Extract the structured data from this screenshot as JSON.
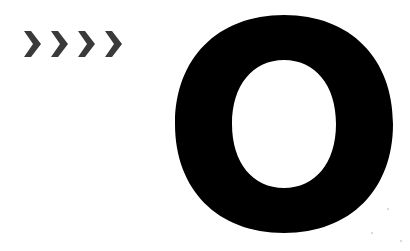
{
  "chevrons": {
    "count": 4,
    "color": "#3a3a3a",
    "items": [
      {
        "icon": "chevron-right-icon"
      },
      {
        "icon": "chevron-right-icon"
      },
      {
        "icon": "chevron-right-icon"
      },
      {
        "icon": "chevron-right-icon"
      }
    ]
  },
  "glyph": {
    "letter": "O",
    "color": "#000000"
  },
  "background": "#ffffff"
}
